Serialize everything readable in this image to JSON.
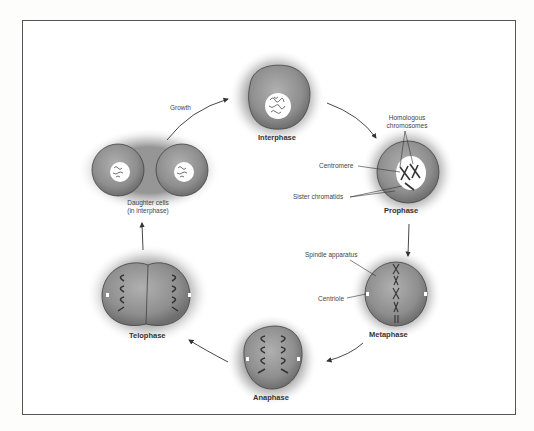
{
  "diagram": {
    "type": "cell-cycle-mitosis",
    "stages": [
      {
        "id": "interphase",
        "label": "Interphase"
      },
      {
        "id": "prophase",
        "label": "Prophase"
      },
      {
        "id": "metaphase",
        "label": "Metaphase"
      },
      {
        "id": "anaphase",
        "label": "Anaphase"
      },
      {
        "id": "telophase",
        "label": "Telophase"
      },
      {
        "id": "daughter",
        "label_line1": "Daughter cells",
        "label_line2": "(in interphase)"
      }
    ],
    "annotations": {
      "growth": "Growth",
      "homologous_line1": "Homologous",
      "homologous_line2": "chromosomes",
      "centromere": "Centromere",
      "sister_chromatids": "Sister chromatids",
      "spindle": "Spindle apparatus",
      "centriole": "Centriole"
    },
    "colors": {
      "cell_fill": "#8f8f8f",
      "cell_edge": "#444444",
      "halo": "#9a9a9a",
      "nucleus": "#ffffff",
      "chromosome": "#333333",
      "arrow": "#333333"
    }
  }
}
